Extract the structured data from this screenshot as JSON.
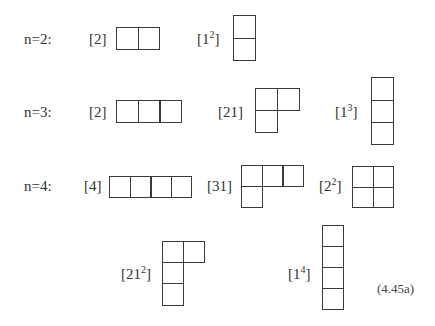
{
  "figure": {
    "equation_number": "(4.45a)",
    "cell_size_px": 21,
    "line_color": "#3a3a3a"
  },
  "rows": [
    {
      "row_label": "n=2:",
      "diagrams": [
        {
          "label_base": "[2]",
          "label_sup": "",
          "partition": [
            2
          ]
        },
        {
          "label_base": "[1",
          "label_sup": "2",
          "label_close": "]",
          "partition": [
            1,
            1
          ]
        }
      ]
    },
    {
      "row_label": "n=3:",
      "diagrams": [
        {
          "label_base": "[2]",
          "label_sup": "",
          "partition": [
            3
          ]
        },
        {
          "label_base": "[21]",
          "label_sup": "",
          "partition": [
            2,
            1
          ]
        },
        {
          "label_base": "[1",
          "label_sup": "3",
          "label_close": "]",
          "partition": [
            1,
            1,
            1
          ]
        }
      ]
    },
    {
      "row_label": "n=4:",
      "diagrams": [
        {
          "label_base": "[4]",
          "label_sup": "",
          "partition": [
            4
          ]
        },
        {
          "label_base": "[31]",
          "label_sup": "",
          "partition": [
            3,
            1
          ]
        },
        {
          "label_base": "[2",
          "label_sup": "2",
          "label_close": "]",
          "partition": [
            2,
            2
          ]
        },
        {
          "label_base": "[21",
          "label_sup": "2",
          "label_close": "]",
          "partition": [
            2,
            1,
            1
          ]
        },
        {
          "label_base": "[1",
          "label_sup": "4",
          "label_close": "]",
          "partition": [
            1,
            1,
            1,
            1
          ]
        }
      ]
    }
  ]
}
